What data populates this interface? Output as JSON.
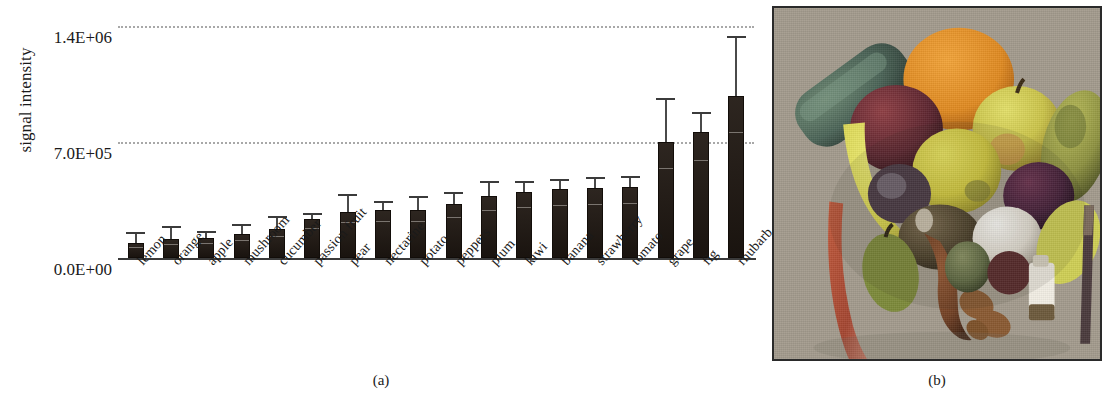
{
  "figure": {
    "panel_a_caption": "(a)",
    "panel_b_caption": "(b)"
  },
  "chart_data": {
    "type": "bar",
    "title": "",
    "xlabel": "",
    "ylabel": "signal intensity",
    "ylim": [
      0,
      1400000
    ],
    "ytick_labels": [
      "0.0E+00",
      "7.0E+05",
      "1.4E+06"
    ],
    "ytick_values": [
      0,
      700000,
      1400000
    ],
    "grid": "horizontal-dotted",
    "legend": "none",
    "error_bars": "standard deviation",
    "categories": [
      "lemon",
      "orange",
      "apple",
      "mushroom",
      "cucumber",
      "passion fruit",
      "pear",
      "nectarine",
      "potato",
      "peppers",
      "plum",
      "kiwi",
      "banana",
      "strawberry",
      "tomato",
      "grape",
      "fig",
      "rhubarb"
    ],
    "values": [
      90000,
      115000,
      120000,
      145000,
      175000,
      235000,
      280000,
      290000,
      290000,
      325000,
      375000,
      400000,
      415000,
      425000,
      430000,
      700000,
      760000,
      980000
    ],
    "errors": [
      55000,
      65000,
      30000,
      50000,
      65000,
      25000,
      95000,
      45000,
      70000,
      60000,
      75000,
      55000,
      50000,
      50000,
      55000,
      255000,
      110000,
      345000
    ]
  },
  "photo": {
    "alt": "photograph of assorted fruits and vegetables arranged on a grey surface",
    "objects": [
      "cucumber",
      "orange",
      "plum",
      "apple",
      "banana",
      "lemon",
      "pear",
      "rhubarb",
      "kiwi",
      "mushroom",
      "passion fruit",
      "grape",
      "fig",
      "nectarine",
      "potato",
      "peppers",
      "strawberry",
      "tomato"
    ]
  }
}
